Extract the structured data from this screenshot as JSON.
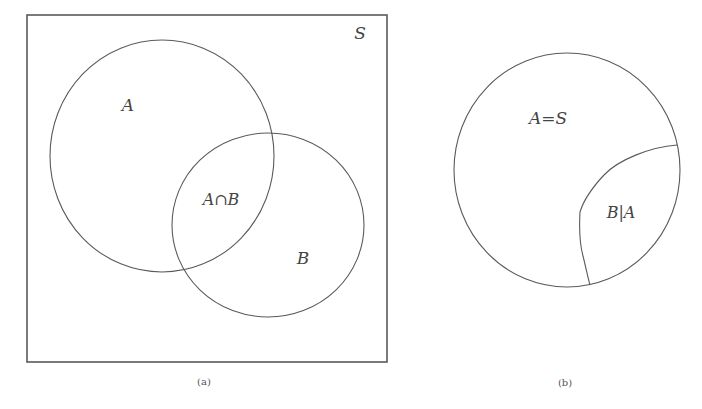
{
  "panels": {
    "a": {
      "caption": "(a)",
      "universe_label": "S",
      "set_a_label": "A",
      "set_b_label": "B",
      "intersection_label": "A∩B"
    },
    "b": {
      "caption": "(b)",
      "universe_label": "A=S",
      "conditional_label": "B|A"
    }
  },
  "colors": {
    "stroke": "#555555",
    "text": "#444444",
    "background": "#ffffff"
  }
}
